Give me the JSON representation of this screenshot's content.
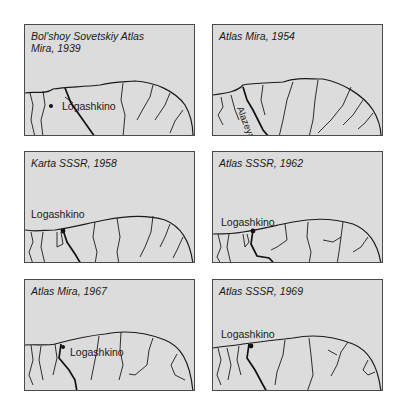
{
  "figure": {
    "panels": [
      {
        "title": "Bol'shoy Sovetskiy Atlas\nMira, 1939",
        "place_label": "Logashkino"
      },
      {
        "title": "Atlas Mira, 1954",
        "river_label": "Alazeya R."
      },
      {
        "title": "Karta SSSR, 1958",
        "place_label": "Logashkino"
      },
      {
        "title": "Atlas SSSR, 1962",
        "place_label": "Logashkino"
      },
      {
        "title": "Atlas Mira, 1967",
        "place_label": "Logashkino"
      },
      {
        "title": "Atlas SSSR, 1969",
        "place_label": "Logashkino"
      }
    ],
    "colors": {
      "land": "#dcdcdc",
      "line": "#1a1a1a",
      "border": "#4a4a4a",
      "background": "#ffffff"
    }
  }
}
